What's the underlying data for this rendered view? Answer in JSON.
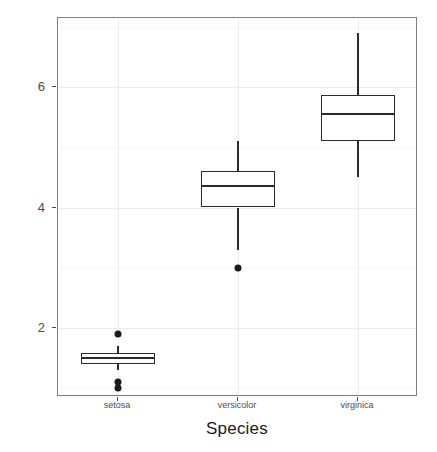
{
  "chart_data": {
    "type": "box",
    "title": "",
    "subtitle": "",
    "xlabel": "Species",
    "ylabel": "Petal.Length",
    "categories": [
      "setosa",
      "versicolor",
      "virginica"
    ],
    "ylim": [
      0.85,
      7.15
    ],
    "y_ticks": [
      2,
      4,
      6
    ],
    "y_tick_labels": [
      "2",
      "4",
      "6"
    ],
    "y_minor_ticks": [
      1,
      3,
      5,
      7
    ],
    "grid": true,
    "legend": "none",
    "boxes": [
      {
        "category": "setosa",
        "whisker_low": 1.3,
        "q1": 1.4,
        "median": 1.5,
        "q3": 1.575,
        "whisker_high": 1.7,
        "outliers": [
          1.9,
          1.1,
          1.0
        ]
      },
      {
        "category": "versicolor",
        "whisker_low": 3.3,
        "q1": 4.0,
        "median": 4.35,
        "q3": 4.6,
        "whisker_high": 5.1,
        "outliers": [
          3.0
        ]
      },
      {
        "category": "virginica",
        "whisker_low": 4.5,
        "q1": 5.1,
        "median": 5.55,
        "q3": 5.875,
        "whisker_high": 6.9,
        "outliers": []
      }
    ]
  },
  "colors": {
    "panel_background": "#ffffff",
    "panel_border": "#808080",
    "grid_major": "#ebebeb",
    "grid_minor": "#f5f5f5",
    "box_stroke": "#2b2b2b",
    "outlier_fill": "#1a1a1a",
    "axis_text": "#4d4d4d",
    "axis_title": "#1a1a1a"
  }
}
